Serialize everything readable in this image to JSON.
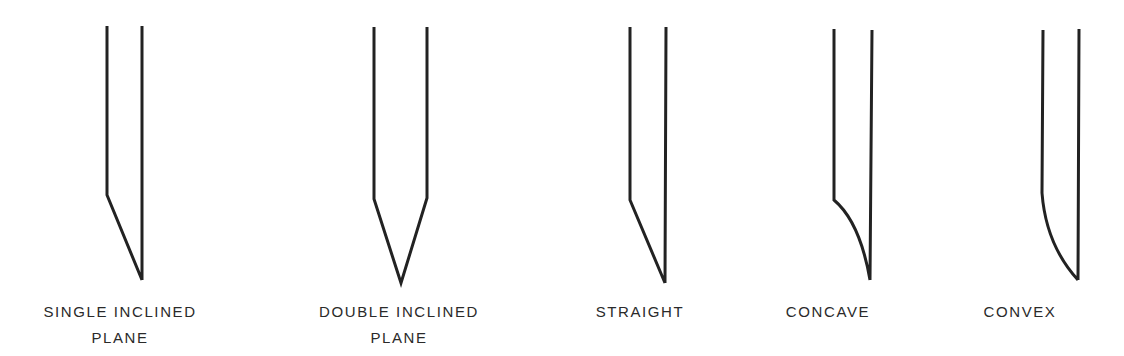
{
  "figure": {
    "stroke_color": "#222222",
    "background": "#ffffff",
    "points": [
      {
        "id": "single-inclined-plane",
        "label_lines": [
          "SINGLE INCLINED",
          "PLANE"
        ],
        "label_center_x": 120,
        "path": "M107,26 L107,195 L142,280 M142,26 L142,280"
      },
      {
        "id": "double-inclined-plane",
        "label_lines": [
          "DOUBLE INCLINED",
          "PLANE"
        ],
        "label_center_x": 399,
        "path": "M374,27 L374,199 L401,283 L427,198 L427,27"
      },
      {
        "id": "straight",
        "label_lines": [
          "STRAIGHT"
        ],
        "label_center_x": 640,
        "path": "M630,27 L630,200 L665,283 M666,27 L665,283"
      },
      {
        "id": "concave",
        "label_lines": [
          "CONCAVE"
        ],
        "label_center_x": 828,
        "path": "M834,29 L834,200 Q860,222 870,280 M872,30 L870,280"
      },
      {
        "id": "convex",
        "label_lines": [
          "CONVEX"
        ],
        "label_center_x": 1020,
        "path": "M1043,30 L1042,193 Q1046,245 1078,280 M1079,29 L1078,280"
      }
    ]
  }
}
